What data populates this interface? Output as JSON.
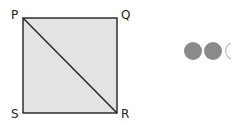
{
  "diagram": {
    "shape": "square",
    "fill_color": "#e3e3e3",
    "stroke_color": "#222222",
    "vertices": {
      "top_left": "P",
      "top_right": "Q",
      "bottom_right": "R",
      "bottom_left": "S"
    },
    "diagonal": "PR"
  },
  "indicator": {
    "dots": [
      {
        "state": "filled",
        "color": "#8a8a8a"
      },
      {
        "state": "filled",
        "color": "#8a8a8a"
      },
      {
        "state": "outline",
        "color": "#bdbdbd"
      }
    ]
  }
}
